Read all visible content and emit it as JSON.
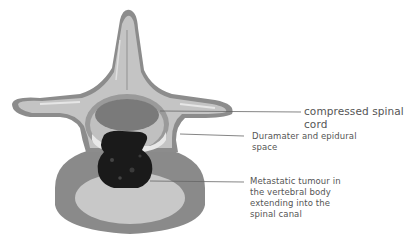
{
  "diagram": {
    "colors": {
      "background": "#ffffff",
      "bone_outline": "#8c8c8c",
      "bone_fill": "#c4c4c4",
      "bone_highlight": "#e2e2e2",
      "vertebral_body_outer": "#8a8a8a",
      "vertebral_body_inner": "#c8c8c8",
      "spinal_cord": "#7a7a7a",
      "dura_ring": "#9a9a9a",
      "epidural_space": "#e8e8e8",
      "tumour": "#1a1a1a",
      "leader_line": "#666666",
      "label_text": "#555555"
    },
    "labels": [
      {
        "id": "spinal-cord",
        "text": "compressed spinal cord"
      },
      {
        "id": "dura",
        "lines": [
          "Duramater and epidural",
          "space"
        ]
      },
      {
        "id": "tumour",
        "lines": [
          "Metastatic tumour in",
          "the vertebral body",
          "extending into the",
          "spinal canal"
        ]
      }
    ]
  }
}
